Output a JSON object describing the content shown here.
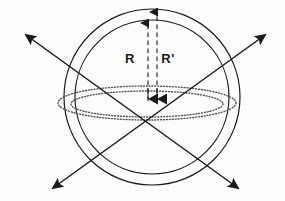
{
  "figure": {
    "background_color": "#fdfdfd",
    "stroke_color": "#1a1a1a",
    "dotted_color": "#555555",
    "width": 285,
    "height": 201,
    "labels": {
      "inner_radius": "R",
      "outer_radius": "R'"
    },
    "label_positions": {
      "inner_radius": {
        "x": 130,
        "y": 63
      },
      "outer_radius": {
        "x": 163,
        "y": 63
      }
    },
    "center": {
      "x": 152,
      "y": 100
    },
    "outer_circle": {
      "cx": 152,
      "cy": 97,
      "r": 88
    },
    "inner_circle": {
      "cx": 152,
      "cy": 97,
      "r": 77
    },
    "outer_ellipse": {
      "cx": 147,
      "cy": 103,
      "rx": 89,
      "ry": 17
    },
    "inner_ellipse": {
      "cx": 147,
      "cy": 104,
      "rx": 76,
      "ry": 13
    },
    "radius_arrow_inner": {
      "x": 148,
      "y_top": 21,
      "y_bottom": 101
    },
    "radius_arrow_outer": {
      "x": 157,
      "y_top": 10,
      "y_bottom": 101
    },
    "diagonal_axis_1": {
      "x1": 26,
      "y1": 35,
      "x2": 238,
      "y2": 188
    },
    "diagonal_axis_2": {
      "x1": 265,
      "y1": 35,
      "x2": 53,
      "y2": 188
    }
  }
}
